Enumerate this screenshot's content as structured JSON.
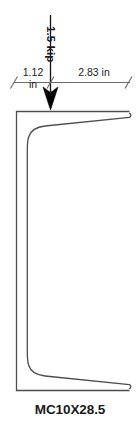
{
  "figure": {
    "section_label": "MC10X28.5",
    "load": {
      "magnitude_label": "1.5 kip",
      "value": 1.5,
      "unit": "kip",
      "direction": "downward",
      "arrow_icon": "down-arrow-icon"
    },
    "dimensions": [
      {
        "name": "left-offset",
        "value_label": "1.12",
        "unit_label": "in",
        "value": 1.12,
        "unit": "in",
        "from": "web-outer-face",
        "to": "load-line"
      },
      {
        "name": "right-offset",
        "value_label": "2.83 in",
        "value": 2.83,
        "unit": "in",
        "from": "load-line",
        "to": "flange-tip"
      }
    ],
    "colors": {
      "outline": "#555555",
      "outline_dark": "#333333",
      "arrow": "#000000",
      "dimension_line": "#666666",
      "text": "#1a1a1a",
      "background": "#ffffff"
    }
  }
}
